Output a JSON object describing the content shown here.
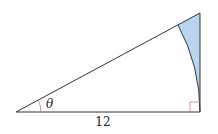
{
  "figure": {
    "type": "right-triangle-with-sector",
    "angle_label": "θ",
    "base_label": "12",
    "colors": {
      "stroke": "#333333",
      "shaded_region": "#b8d4ef",
      "angle_marker": "#d9708a",
      "right_angle_marker": "#d9708a"
    }
  }
}
